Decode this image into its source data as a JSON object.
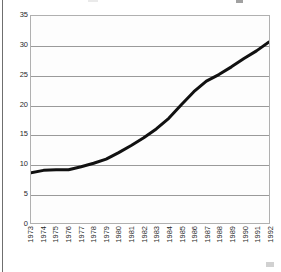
{
  "chart_data": {
    "type": "line",
    "title": "",
    "subtitle": "",
    "xlabel": "",
    "ylabel": "",
    "x": [
      "1973",
      "1974",
      "1975",
      "1976",
      "1977",
      "1978",
      "1979",
      "1980",
      "1981",
      "1982",
      "1983",
      "1984",
      "1985",
      "1986",
      "1987",
      "1988",
      "1989",
      "1990",
      "1991",
      "1992"
    ],
    "categories": [
      "1973",
      "1974",
      "1975",
      "1976",
      "1977",
      "1978",
      "1979",
      "1980",
      "1981",
      "1982",
      "1983",
      "1984",
      "1985",
      "1986",
      "1987",
      "1988",
      "1989",
      "1990",
      "1991",
      "1992"
    ],
    "values": [
      8.5,
      8.9,
      9.0,
      9.0,
      9.5,
      10.1,
      10.8,
      11.9,
      13.1,
      14.4,
      15.9,
      17.7,
      20.0,
      22.2,
      24.0,
      25.1,
      26.4,
      27.8,
      29.1,
      30.6
    ],
    "series": [
      {
        "name": "series-1",
        "color": "#111111",
        "values": [
          8.5,
          8.9,
          9.0,
          9.0,
          9.5,
          10.1,
          10.8,
          11.9,
          13.1,
          14.4,
          15.9,
          17.7,
          20.0,
          22.2,
          24.0,
          25.1,
          26.4,
          27.8,
          29.1,
          30.6
        ]
      }
    ],
    "ylim": [
      0,
      35
    ],
    "y_ticks": [
      0,
      5,
      10,
      15,
      20,
      25,
      30,
      35
    ],
    "y_tick_labels": [
      "0",
      "5",
      "10",
      "15",
      "20",
      "25",
      "30",
      "35"
    ],
    "x_tick_labels": [
      "1973",
      "1974",
      "1975",
      "1976",
      "1977",
      "1978",
      "1979",
      "1980",
      "1981",
      "1982",
      "1983",
      "1984",
      "1985",
      "1986",
      "1987",
      "1988",
      "1989",
      "1990",
      "1991",
      "1992"
    ],
    "x_tick_rotation": -90,
    "grid": {
      "horizontal": true,
      "vertical": false,
      "color": "#9a9a9a"
    },
    "legend": {
      "visible": false,
      "position": "none"
    },
    "plot_border_color": "#b0b0b0",
    "plot_background": "#fdfdfd",
    "line_color": "#111111",
    "line_width": 3,
    "markers": false,
    "annotations": []
  }
}
